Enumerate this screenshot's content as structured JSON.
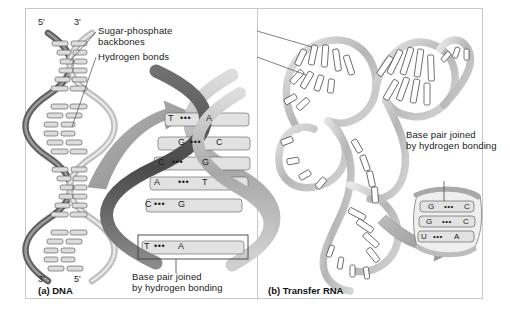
{
  "figure": {
    "background_color": "#ffffff",
    "frame_color": "#c9c9c9"
  },
  "panels": [
    {
      "id": "dna",
      "caption": "(a) DNA",
      "end_labels": {
        "top_left": "5'",
        "top_right": "3'",
        "bottom_left": "3'",
        "bottom_right": "5'"
      },
      "annotations": [
        {
          "name": "sugar-phosphate-backbones",
          "line1": "Sugar-phosphate",
          "line2": "backbones"
        },
        {
          "name": "hydrogen-bonds",
          "line1": "Hydrogen bonds",
          "line2": ""
        }
      ],
      "inset_note": {
        "line1": "Base pair joined",
        "line2": "by hydrogen bonding"
      },
      "base_pairs": [
        {
          "left": "T",
          "right": "A",
          "bond": "•••",
          "highlighted": false
        },
        {
          "left": "G",
          "right": "C",
          "bond": "•••",
          "highlighted": false
        },
        {
          "left": "C",
          "right": "G",
          "bond": "•••",
          "highlighted": false
        },
        {
          "left": "A",
          "right": "T",
          "bond": "•••",
          "highlighted": false
        },
        {
          "left": "C",
          "right": "G",
          "bond": "•••",
          "highlighted": false
        },
        {
          "left": "T",
          "right": "A",
          "bond": "•••",
          "highlighted": true
        }
      ]
    },
    {
      "id": "trna",
      "caption": "(b) Transfer RNA",
      "inset_note": {
        "line1": "Base pair joined",
        "line2": "by hydrogen bonding"
      },
      "base_pairs": [
        {
          "left": "G",
          "right": "C",
          "bond": "•••"
        },
        {
          "left": "G",
          "right": "C",
          "bond": "•••"
        },
        {
          "left": "U",
          "right": "A",
          "bond": "•••"
        }
      ]
    }
  ],
  "colors": {
    "backbone_dark": "#6e6e6e",
    "backbone_light": "#c2c2c2",
    "base_fill": "#dcdcdc",
    "outline": "#3a3a3a",
    "arrow": "#9a9a9a",
    "text": "#1b1b1b"
  }
}
